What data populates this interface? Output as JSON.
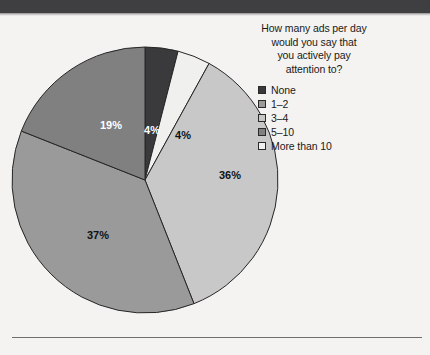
{
  "page": {
    "background_color": "#f4f3f1",
    "top_bar_color": "#3f3f41"
  },
  "legend": {
    "title": "How many ads per day\nwould you say that\nyou actively pay\nattention to?",
    "items": [
      {
        "label": "None",
        "color": "#3a3a3c"
      },
      {
        "label": "1–2",
        "color": "#9a9a9a"
      },
      {
        "label": "3–4",
        "color": "#c8c8c8"
      },
      {
        "label": "5–10",
        "color": "#808080"
      },
      {
        "label": "More than 10",
        "color": "#f0f0ee"
      }
    ]
  },
  "chart_data": {
    "type": "pie",
    "title": "How many ads per day would you say that you actively pay attention to?",
    "xlabel": "",
    "ylabel": "",
    "unit": "percent",
    "start_angle_deg": 0,
    "direction": "clockwise",
    "legend_position": "top-right",
    "grid": false,
    "categories": [
      "None",
      "More than 10",
      "3–4",
      "1–2",
      "5–10"
    ],
    "values": [
      4,
      4,
      36,
      37,
      19
    ],
    "slices": [
      {
        "name": "None",
        "value": 4,
        "label": "4%",
        "color": "#3a3a3c",
        "label_color": "#ffffff",
        "label_x": 152,
        "label_y": 131
      },
      {
        "name": "More than 10",
        "value": 4,
        "label": "4%",
        "color": "#f0f0ee",
        "label_color": "#111111",
        "label_x": 183,
        "label_y": 136
      },
      {
        "name": "3–4",
        "value": 36,
        "label": "36%",
        "color": "#c8c8c8",
        "label_color": "#111111",
        "label_x": 230,
        "label_y": 176
      },
      {
        "name": "1–2",
        "value": 37,
        "label": "37%",
        "color": "#9a9a9a",
        "label_color": "#111111",
        "label_x": 98,
        "label_y": 236
      },
      {
        "name": "5–10",
        "value": 19,
        "label": "19%",
        "color": "#808080",
        "label_color": "#ffffff",
        "label_x": 111,
        "label_y": 126
      }
    ]
  }
}
